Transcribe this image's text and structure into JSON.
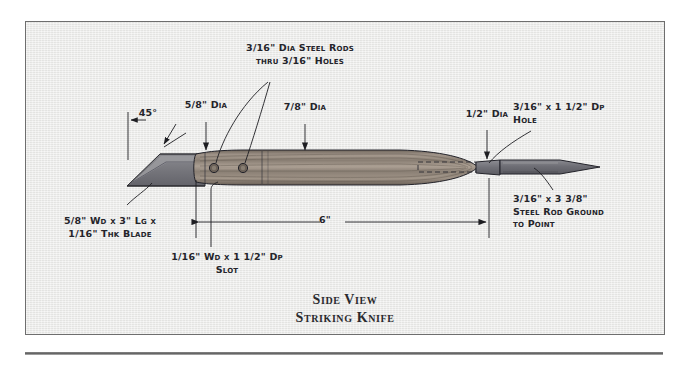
{
  "document": {
    "figure_title_line1": "Side View",
    "figure_title_line2": "Striking Knife",
    "panel": {
      "background_color": "#e8e8e6",
      "border_color": "#6e6e6e"
    }
  },
  "drawing": {
    "type": "technical-plan-side-view",
    "subject": "Striking Knife",
    "colors": {
      "blade_steel": "#7b7b80",
      "blade_bevel": "#9a9a9d",
      "handle_wood": "#8d8176",
      "handle_wood_light": "#a69a8c",
      "rod_steel": "#74747a",
      "line": "#1e1e22"
    },
    "parts": [
      {
        "name": "blade",
        "label": "5/8\" Wd x 3\" Lg x 1/16\" Thk Blade"
      },
      {
        "name": "handle",
        "label": "7/8\" Dia"
      },
      {
        "name": "ferrule",
        "label": "1/2\" Dia"
      },
      {
        "name": "steel-rod-point",
        "label": "3/16\" x 3 3/8\" Steel Rod Ground to Point"
      }
    ]
  },
  "annotations": {
    "angle_45": {
      "text": "45°"
    },
    "dia_5_8": {
      "whole": "",
      "frac": "5⁄8",
      "unit": "\" Dia",
      "text": "5/8\" Dia"
    },
    "rods_holes": {
      "line1_frac": "3⁄16",
      "line1_rest": "\" Dia Steel Rods",
      "line2_pre": "thru ",
      "line2_frac": "3⁄16",
      "line2_rest": "\" Holes",
      "text": "3/16\" Dia Steel Rods thru 3/16\" Holes"
    },
    "dia_7_8": {
      "frac": "7⁄8",
      "unit": "\" Dia",
      "text": "7/8\" Dia"
    },
    "dia_1_2": {
      "frac": "1⁄2",
      "unit": "\" Dia",
      "text": "1/2\" Dia"
    },
    "hole_right": {
      "line1_frac": "3⁄16",
      "line1_mid": "\" x 1",
      "line1_frac2": "1⁄2",
      "line1_rest": "\" Dp",
      "line2": "Hole",
      "text": "3/16\" x 1 1/2\" Dp Hole"
    },
    "steel_rod": {
      "line1_frac": "3⁄16",
      "line1_mid": "\" x 3",
      "line1_frac2": "3⁄8",
      "line1_rest": "\"",
      "line2": "Steel Rod",
      "line3": "Ground",
      "line4": "to Point",
      "text": "3/16\" x 3 3/8\" Steel Rod Ground to Point"
    },
    "blade_spec": {
      "line1_frac": "5⁄8",
      "line1_rest": "\" Wd x 3\" Lg x",
      "line2_frac": "1⁄16",
      "line2_rest": "\" Thk Blade",
      "text": "5/8\" Wd x 3\" Lg x 1/16\" Thk Blade"
    },
    "slot_spec": {
      "line1_frac": "1⁄16",
      "line1_mid": "\" Wd x 1",
      "line1_frac2": "1⁄2",
      "line1_rest": "\" Dp",
      "line2": "Slot",
      "text": "1/16\" Wd x 1 1/2\" Dp Slot"
    },
    "dimension_6in": {
      "text": "6\"",
      "value": 6,
      "unit": "in"
    }
  }
}
